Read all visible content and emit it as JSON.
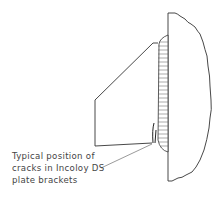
{
  "diagram": {
    "caption": {
      "line1": "Typical position of",
      "line2": "cracks in Incoloy DS",
      "line3": "plate brackets"
    },
    "parts": [
      "wall-section",
      "weld-bead",
      "plate-bracket",
      "crack",
      "leader-line"
    ]
  }
}
